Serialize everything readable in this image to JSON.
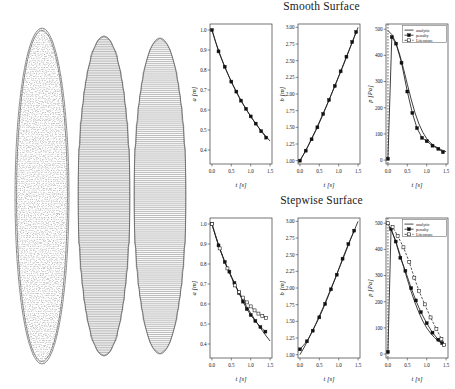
{
  "figure": {
    "mesh_panel_label": "bubble-shape-meshes",
    "shapes": [
      {
        "name": "smooth-ellipse-mesh",
        "style": "speckled",
        "cx": 42,
        "cy": 196,
        "rx": 27,
        "ry": 168,
        "layers": 150
      },
      {
        "name": "stepwise-ellipse-mesh-coarse",
        "style": "stairs",
        "cx": 104,
        "cy": 196,
        "rx": 26,
        "ry": 160,
        "layers": 62
      },
      {
        "name": "stepwise-ellipse-mesh-fine",
        "style": "stairs",
        "cx": 160,
        "cy": 196,
        "rx": 26,
        "ry": 158,
        "layers": 54
      }
    ]
  },
  "rows": [
    {
      "title": "Smooth Surface"
    },
    {
      "title": "Stepwise Surface"
    }
  ],
  "legend": {
    "entries": [
      {
        "label": "analytic",
        "style": "line"
      },
      {
        "label": "penalty",
        "style": "line-marker"
      },
      {
        "label": "Literature",
        "style": "dash-marker"
      }
    ]
  },
  "chart_data": [
    {
      "id": "smooth-a",
      "type": "line",
      "title": "Smooth Surface",
      "xlabel": "t [s]",
      "ylabel": "a [m]",
      "xlim": [
        -0.05,
        1.55
      ],
      "ylim": [
        0.33,
        1.03
      ],
      "xticks": [
        0.0,
        0.5,
        1.0,
        1.5
      ],
      "xticklabels": [
        "0.0",
        "0.5",
        "1.0",
        "1.5"
      ],
      "yticks": [
        0.4,
        0.5,
        0.6,
        0.7,
        0.8,
        0.9,
        1.0
      ],
      "yticklabels": [
        "0.4",
        "0.5",
        "0.6",
        "0.7",
        "0.8",
        "0.9",
        "1.0"
      ],
      "grid": false,
      "series": [
        {
          "name": "analytic",
          "style": "line",
          "x": [
            0.0,
            0.1,
            0.2,
            0.3,
            0.4,
            0.5,
            0.6,
            0.7,
            0.8,
            0.9,
            1.0,
            1.1,
            1.2,
            1.3,
            1.4,
            1.5
          ],
          "y": [
            1.0,
            0.938,
            0.882,
            0.831,
            0.784,
            0.741,
            0.701,
            0.664,
            0.63,
            0.598,
            0.568,
            0.54,
            0.514,
            0.49,
            0.467,
            0.445
          ]
        },
        {
          "name": "penalty",
          "style": "marker",
          "x": [
            0.0,
            0.17,
            0.33,
            0.5,
            0.63,
            0.75,
            0.88,
            1.0,
            1.13,
            1.27,
            1.4
          ],
          "y": [
            1.0,
            0.893,
            0.816,
            0.742,
            0.692,
            0.647,
            0.606,
            0.568,
            0.532,
            0.494,
            0.462
          ]
        }
      ]
    },
    {
      "id": "smooth-b",
      "type": "line",
      "xlabel": "t [s]",
      "ylabel": "b [m]",
      "xlim": [
        -0.05,
        1.55
      ],
      "ylim": [
        0.95,
        3.05
      ],
      "xticks": [
        0.0,
        0.5,
        1.0,
        1.5
      ],
      "xticklabels": [
        "0.0",
        "0.5",
        "1.0",
        "1.5"
      ],
      "yticks": [
        1.0,
        1.25,
        1.5,
        1.75,
        2.0,
        2.25,
        2.5,
        2.75,
        3.0
      ],
      "yticklabels": [
        "1.00",
        "1.25",
        "1.50",
        "1.75",
        "2.00",
        "2.25",
        "2.50",
        "2.75",
        "3.00"
      ],
      "grid": false,
      "series": [
        {
          "name": "analytic",
          "style": "line",
          "x": [
            0.0,
            0.1,
            0.2,
            0.3,
            0.4,
            0.5,
            0.6,
            0.7,
            0.8,
            0.9,
            1.0,
            1.1,
            1.2,
            1.3,
            1.4,
            1.5
          ],
          "y": [
            1.0,
            1.1,
            1.21,
            1.33,
            1.45,
            1.58,
            1.71,
            1.84,
            1.98,
            2.12,
            2.26,
            2.4,
            2.55,
            2.7,
            2.85,
            3.0
          ]
        },
        {
          "name": "penalty",
          "style": "marker",
          "x": [
            0.0,
            0.15,
            0.3,
            0.45,
            0.6,
            0.75,
            0.9,
            1.05,
            1.2,
            1.35,
            1.45
          ],
          "y": [
            1.0,
            1.15,
            1.32,
            1.5,
            1.7,
            1.91,
            2.12,
            2.34,
            2.56,
            2.78,
            2.93
          ]
        }
      ]
    },
    {
      "id": "smooth-p",
      "type": "line",
      "xlabel": "t [s]",
      "ylabel": "p [Pa]",
      "xlim": [
        -0.05,
        1.55
      ],
      "ylim": [
        -15,
        520
      ],
      "xticks": [
        0.0,
        0.5,
        1.0,
        1.5
      ],
      "xticklabels": [
        "0.0",
        "0.5",
        "1.0",
        "1.5"
      ],
      "yticks": [
        0,
        100,
        200,
        300,
        400,
        500
      ],
      "yticklabels": [
        "0",
        "100",
        "200",
        "300",
        "400",
        "500"
      ],
      "grid": false,
      "vline_at": 0.0,
      "series": [
        {
          "name": "analytic",
          "style": "line",
          "x": [
            0.0,
            0.1,
            0.2,
            0.3,
            0.4,
            0.5,
            0.6,
            0.7,
            0.8,
            0.9,
            1.0,
            1.1,
            1.2,
            1.3,
            1.4,
            1.5
          ],
          "y": [
            495,
            480,
            450,
            405,
            350,
            290,
            232,
            180,
            138,
            106,
            82,
            66,
            54,
            45,
            38,
            32
          ]
        },
        {
          "name": "penalty",
          "style": "marker",
          "x": [
            0.0,
            0.1,
            0.21,
            0.35,
            0.5,
            0.63,
            0.75,
            0.88,
            1.0,
            1.15,
            1.3,
            1.42
          ],
          "y": [
            5,
            470,
            445,
            372,
            262,
            180,
            122,
            85,
            72,
            55,
            43,
            30
          ]
        }
      ]
    },
    {
      "id": "stepwise-a",
      "type": "line",
      "title": "Stepwise Surface",
      "xlabel": "t [s]",
      "ylabel": "a [m]",
      "xlim": [
        -0.05,
        1.55
      ],
      "ylim": [
        0.33,
        1.03
      ],
      "xticks": [
        0.0,
        0.5,
        1.0,
        1.5
      ],
      "xticklabels": [
        "0.0",
        "0.5",
        "1.0",
        "1.5"
      ],
      "yticks": [
        0.4,
        0.5,
        0.6,
        0.7,
        0.8,
        0.9,
        1.0
      ],
      "yticklabels": [
        "0.4",
        "0.5",
        "0.6",
        "0.7",
        "0.8",
        "0.9",
        "1.0"
      ],
      "grid": false,
      "series": [
        {
          "name": "analytic",
          "style": "line",
          "x": [
            0.0,
            0.1,
            0.2,
            0.3,
            0.4,
            0.5,
            0.6,
            0.7,
            0.8,
            0.9,
            1.0,
            1.1,
            1.2,
            1.3,
            1.4,
            1.5
          ],
          "y": [
            1.0,
            0.935,
            0.878,
            0.826,
            0.778,
            0.734,
            0.693,
            0.655,
            0.62,
            0.586,
            0.554,
            0.524,
            0.495,
            0.467,
            0.44,
            0.415
          ]
        },
        {
          "name": "penalty",
          "style": "marker",
          "x": [
            0.0,
            0.17,
            0.33,
            0.45,
            0.58,
            0.7,
            0.8,
            0.9,
            1.0,
            1.12,
            1.25,
            1.38
          ],
          "y": [
            1.0,
            0.893,
            0.81,
            0.762,
            0.705,
            0.655,
            0.612,
            0.575,
            0.545,
            0.515,
            0.485,
            0.462
          ]
        },
        {
          "name": "Literature",
          "style": "dash-marker",
          "x": [
            0.0,
            0.2,
            0.4,
            0.6,
            0.7,
            0.8,
            0.9,
            1.0,
            1.1,
            1.2,
            1.3,
            1.4
          ],
          "y": [
            1.0,
            0.878,
            0.778,
            0.693,
            0.66,
            0.632,
            0.608,
            0.588,
            0.568,
            0.552,
            0.54,
            0.53
          ]
        }
      ]
    },
    {
      "id": "stepwise-b",
      "type": "line",
      "xlabel": "t [s]",
      "ylabel": "b [m]",
      "xlim": [
        -0.05,
        1.55
      ],
      "ylim": [
        0.95,
        3.05
      ],
      "xticks": [
        0.0,
        0.5,
        1.0,
        1.5
      ],
      "xticklabels": [
        "0.0",
        "0.5",
        "1.0",
        "1.5"
      ],
      "yticks": [
        1.0,
        1.25,
        1.5,
        1.75,
        2.0,
        2.25,
        2.5,
        2.75,
        3.0
      ],
      "yticklabels": [
        "1.00",
        "1.25",
        "1.50",
        "1.75",
        "2.00",
        "2.25",
        "2.50",
        "2.75",
        "3.00"
      ],
      "grid": false,
      "series": [
        {
          "name": "analytic",
          "style": "line",
          "x": [
            0.0,
            0.1,
            0.2,
            0.3,
            0.4,
            0.5,
            0.6,
            0.7,
            0.8,
            0.9,
            1.0,
            1.1,
            1.2,
            1.3,
            1.4,
            1.5
          ],
          "y": [
            1.0,
            1.1,
            1.21,
            1.33,
            1.45,
            1.58,
            1.71,
            1.85,
            1.99,
            2.13,
            2.28,
            2.42,
            2.57,
            2.72,
            2.86,
            3.0
          ]
        },
        {
          "name": "penalty",
          "style": "marker",
          "x": [
            0.0,
            0.18,
            0.33,
            0.5,
            0.65,
            0.8,
            0.95,
            1.1,
            1.25,
            1.4
          ],
          "y": [
            1.08,
            1.2,
            1.36,
            1.56,
            1.76,
            1.98,
            2.2,
            2.44,
            2.66,
            2.86
          ]
        }
      ]
    },
    {
      "id": "stepwise-p",
      "type": "line",
      "xlabel": "t [s]",
      "ylabel": "p [Pa]",
      "xlim": [
        -0.05,
        1.55
      ],
      "ylim": [
        -15,
        520
      ],
      "xticks": [
        0.0,
        0.5,
        1.0,
        1.5
      ],
      "xticklabels": [
        "0.0",
        "0.5",
        "1.0",
        "1.5"
      ],
      "yticks": [
        0,
        100,
        200,
        300,
        400,
        500
      ],
      "yticklabels": [
        "0",
        "100",
        "200",
        "300",
        "400",
        "500"
      ],
      "grid": false,
      "vline_at": 0.0,
      "series": [
        {
          "name": "analytic",
          "style": "line",
          "x": [
            0.0,
            0.1,
            0.2,
            0.3,
            0.4,
            0.5,
            0.6,
            0.7,
            0.8,
            0.9,
            1.0,
            1.1,
            1.2,
            1.3,
            1.4,
            1.5
          ],
          "y": [
            498,
            470,
            432,
            386,
            336,
            286,
            238,
            196,
            158,
            126,
            100,
            80,
            63,
            50,
            40,
            32
          ]
        },
        {
          "name": "penalty",
          "style": "marker",
          "x": [
            0.0,
            0.08,
            0.2,
            0.32,
            0.45,
            0.6,
            0.72,
            0.85,
            1.0,
            1.15,
            1.3,
            1.4
          ],
          "y": [
            8,
            478,
            430,
            368,
            318,
            252,
            205,
            160,
            118,
            82,
            55,
            42
          ]
        },
        {
          "name": "Literature",
          "style": "dash-marker",
          "x": [
            0.0,
            0.12,
            0.25,
            0.4,
            0.55,
            0.68,
            0.8,
            0.95,
            1.1,
            1.25,
            1.38,
            1.45
          ],
          "y": [
            500,
            486,
            452,
            408,
            352,
            292,
            242,
            190,
            140,
            96,
            58,
            35
          ]
        }
      ]
    }
  ]
}
